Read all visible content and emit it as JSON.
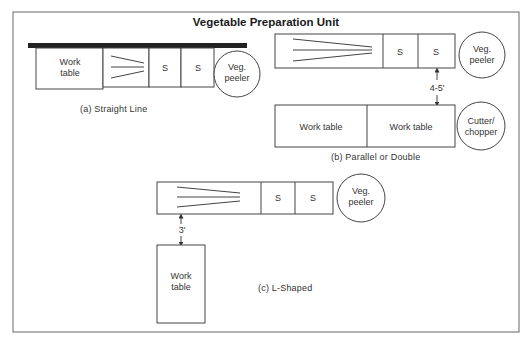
{
  "title": "Vegetable Preparation Unit",
  "layouts": {
    "a": {
      "caption": "(a)  Straight Line",
      "work_table": [
        "Work",
        "table"
      ],
      "sink1": "S",
      "sink2": "S",
      "peeler": [
        "Veg.",
        "peeler"
      ]
    },
    "b": {
      "caption": "(b)  Parallel or Double",
      "sink1": "S",
      "sink2": "S",
      "peeler": [
        "Veg.",
        "peeler"
      ],
      "distance": "4-5'",
      "work_table_1": "Work table",
      "work_table_2": "Work table",
      "cutter": [
        "Cutter/",
        "chopper"
      ]
    },
    "c": {
      "caption": "(c)  L-Shaped",
      "sink1": "S",
      "sink2": "S",
      "peeler": [
        "Veg.",
        "peeler"
      ],
      "distance": "3'",
      "work_table": [
        "Work",
        "table"
      ]
    }
  }
}
